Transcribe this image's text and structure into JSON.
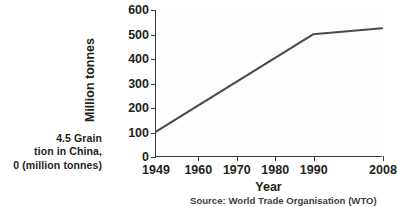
{
  "caption": {
    "lines": [
      "4.5  Grain",
      "tion in China,",
      "0 (million tonnes)"
    ]
  },
  "source_note": "Source: World Trade Organisation (WTO)",
  "colors": {
    "line": "#4a4a4a",
    "axis": "#3b3b3b",
    "text": "#231f20",
    "plot_background": "#fdfdfd"
  },
  "chart_data": {
    "type": "line",
    "title": "",
    "xlabel": "Year",
    "ylabel": "Million tonnes",
    "xlim": [
      1949,
      2008
    ],
    "ylim": [
      0,
      600
    ],
    "grid": false,
    "legend": null,
    "x_ticks": [
      1949,
      1960,
      1970,
      1980,
      1990,
      2008
    ],
    "x_tick_labels": [
      "1949",
      "1960",
      "1970",
      "1980",
      "1990",
      "2008"
    ],
    "y_ticks": [
      0,
      100,
      200,
      300,
      400,
      500,
      600
    ],
    "y_tick_labels": [
      "0",
      "100",
      "200",
      "300",
      "400",
      "500",
      "600"
    ],
    "series": [
      {
        "name": "Grain production in China",
        "x": [
          1949,
          1990,
          2008
        ],
        "values": [
          100,
          500,
          525
        ]
      }
    ]
  }
}
